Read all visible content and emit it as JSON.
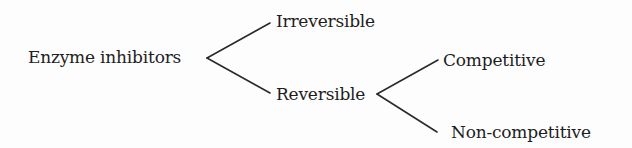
{
  "diagram": {
    "type": "tree",
    "root": {
      "label": "Enzyme inhibitors",
      "children": [
        {
          "label": "Irreversible"
        },
        {
          "label": "Reversible",
          "children": [
            {
              "label": "Competitive"
            },
            {
              "label": "Non-competitive"
            }
          ]
        }
      ]
    }
  },
  "nodes": {
    "root": "Enzyme inhibitors",
    "irreversible": "Irreversible",
    "reversible": "Reversible",
    "competitive": "Competitive",
    "non_competitive": "Non-competitive"
  },
  "colors": {
    "text": "#1e1e1e",
    "line": "#2a2a2a",
    "background": "#fdfdfd"
  }
}
